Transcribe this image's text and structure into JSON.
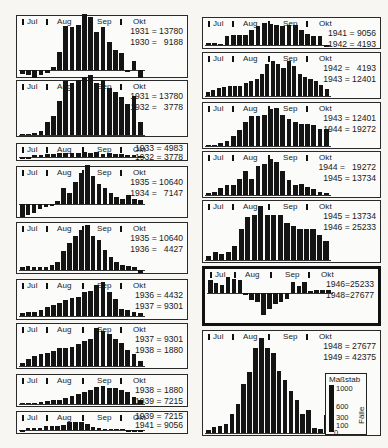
{
  "chart_data": {
    "type": "bar",
    "title": "",
    "xlabel": "Weekly periods Jul–Okt",
    "ylabel": "Fälle",
    "month_labels": [
      "Jul",
      "Aug",
      "Sep",
      "Okt"
    ],
    "scale": {
      "title": "Maßstab",
      "axis_label": "Fälle",
      "ticks": [
        "1000",
        "600",
        "300",
        "100",
        "0"
      ],
      "ylim": [
        0,
        1000
      ]
    },
    "panels": [
      {
        "id": "L1",
        "line1": "1931 = 13780",
        "line2": "1930 =   9188",
        "box": [
          16,
          15,
          172,
          63
        ],
        "baseline": 54,
        "unit": 0.045,
        "values": [
          -80,
          -100,
          -180,
          -120,
          -60,
          60,
          400,
          980,
          950,
          1000,
          1240,
          1180,
          840,
          960,
          620,
          450,
          380,
          -30,
          200,
          -180
        ]
      },
      {
        "id": "L2",
        "line1": "1931 = 13780",
        "line2": "1932 =   3778",
        "box": [
          16,
          80,
          172,
          57
        ],
        "baseline": 54,
        "unit": 0.045,
        "values": [
          0,
          20,
          40,
          100,
          300,
          420,
          750,
          1200,
          1150,
          1220,
          1300,
          1340,
          1160,
          1220,
          1050,
          950,
          840,
          700,
          860,
          280
        ]
      },
      {
        "id": "L3",
        "line1": "1933 = 4983",
        "line2": "1932 = 3778",
        "box": [
          16,
          143,
          172,
          18
        ],
        "baseline": 13,
        "unit": 0.045,
        "values": [
          -20,
          -20,
          40,
          40,
          60,
          60,
          80,
          80,
          100,
          80,
          110,
          100,
          120,
          60,
          100,
          60,
          60,
          40,
          40,
          20
        ]
      },
      {
        "id": "L4",
        "line1": "1935 = 10640",
        "line2": "1934 =   7147",
        "box": [
          16,
          166,
          172,
          52
        ],
        "baseline": 37,
        "unit": 0.045,
        "values": [
          -280,
          -240,
          -200,
          -120,
          -60,
          -20,
          60,
          360,
          240,
          500,
          700,
          860,
          620,
          440,
          360,
          240,
          160,
          120,
          200,
          120,
          100
        ]
      },
      {
        "id": "L5",
        "line1": "1935 = 10640",
        "line2": "1936 =   4427",
        "box": [
          16,
          222,
          172,
          52
        ],
        "baseline": 47,
        "unit": 0.045,
        "values": [
          60,
          80,
          60,
          60,
          60,
          120,
          180,
          420,
          600,
          760,
          900,
          1000,
          760,
          660,
          440,
          280,
          180,
          120,
          100,
          60,
          -60
        ]
      },
      {
        "id": "L6",
        "line1": "1936 = 4432",
        "line2": "1937 = 9301",
        "box": [
          16,
          279,
          172,
          41
        ],
        "baseline": 36,
        "unit": 0.045,
        "values": [
          60,
          80,
          100,
          140,
          200,
          240,
          300,
          360,
          400,
          420,
          540,
          560,
          700,
          760,
          540,
          380,
          160,
          140,
          100,
          60
        ]
      },
      {
        "id": "L7",
        "line1": "1937 = 9301",
        "line2": "1938 = 1880",
        "box": [
          16,
          323,
          172,
          46
        ],
        "baseline": 42,
        "unit": 0.045,
        "values": [
          60,
          160,
          220,
          260,
          280,
          340,
          400,
          400,
          420,
          480,
          560,
          600,
          840,
          780,
          720,
          600,
          520,
          360,
          260,
          120
        ]
      },
      {
        "id": "L8",
        "line1": "1938 = 1880",
        "line2": "1939 = 7215",
        "box": [
          16,
          374,
          172,
          33
        ],
        "baseline": 29,
        "unit": 0.03,
        "values": [
          40,
          40,
          40,
          60,
          100,
          120,
          140,
          200,
          260,
          320,
          400,
          480,
          560,
          600,
          540,
          520,
          480,
          400,
          240,
          120
        ]
      },
      {
        "id": "L9",
        "line1": "1939 = 7215",
        "line2": "1941 = 9056",
        "box": [
          16,
          411,
          172,
          23
        ],
        "baseline": 18,
        "unit": 0.03,
        "values": [
          -40,
          80,
          60,
          60,
          120,
          140,
          140,
          180,
          260,
          260,
          260,
          200,
          100,
          80,
          40,
          40,
          40,
          20,
          -40,
          -40,
          -40
        ]
      },
      {
        "id": "R1",
        "line1": "1941 = 9056",
        "line2": "1942 = 4193",
        "box": [
          202,
          17,
          179,
          32
        ],
        "baseline": 27,
        "unit": 0.035,
        "values": [
          60,
          60,
          20,
          260,
          280,
          280,
          300,
          440,
          540,
          620,
          600,
          560,
          540,
          560,
          560,
          420,
          320,
          260,
          260,
          -20
        ]
      },
      {
        "id": "R2",
        "line1": "1942 =   4193",
        "line2": "1943 = 12401",
        "box": [
          202,
          52,
          179,
          47
        ],
        "baseline": 43,
        "unit": 0.035,
        "values": [
          120,
          160,
          220,
          260,
          300,
          300,
          300,
          380,
          440,
          500,
          640,
          920,
          1000,
          920,
          800,
          1000,
          860,
          640,
          540,
          480,
          420,
          320,
          200
        ]
      },
      {
        "id": "R3",
        "line1": "1943 = 12401",
        "line2": "1944 = 19272",
        "box": [
          202,
          102,
          179,
          47
        ],
        "baseline": 43,
        "unit": 0.035,
        "values": [
          20,
          40,
          80,
          140,
          280,
          460,
          680,
          860,
          860,
          900,
          1060,
          1080,
          900,
          760,
          680,
          640,
          640,
          600,
          500,
          500
        ]
      },
      {
        "id": "R4",
        "line1": "1944 =   19272",
        "line2": "1945 = 13734",
        "box": [
          202,
          151,
          179,
          47
        ],
        "baseline": 43,
        "unit": 0.035,
        "values": [
          60,
          100,
          200,
          300,
          280,
          460,
          680,
          460,
          820,
          880,
          1040,
          940,
          680,
          440,
          300,
          320,
          240,
          180,
          100,
          60
        ]
      },
      {
        "id": "R5",
        "line1": "1945 = 13734",
        "line2": "1946 = 25233",
        "box": [
          202,
          200,
          179,
          63
        ],
        "baseline": 59,
        "unit": 0.045,
        "values": [
          80,
          180,
          140,
          180,
          320,
          700,
          960,
          1000,
          1200,
          1000,
          1000,
          1000,
          820,
          760,
          700,
          700,
          700,
          560,
          420
        ]
      },
      {
        "id": "R6",
        "line1": "1946=25233",
        "line2": "1948=27677",
        "thick": true,
        "box": [
          202,
          266,
          179,
          60
        ],
        "baseline": 24,
        "unit": 0.03,
        "values": [
          420,
          320,
          280,
          520,
          460,
          440,
          -60,
          -220,
          -300,
          -740,
          -540,
          -360,
          -300,
          -200,
          360,
          240,
          380,
          60,
          100,
          100,
          100
        ]
      },
      {
        "id": "R7",
        "line1": "1948 = 27677",
        "line2": "1949 = 42375",
        "box": [
          202,
          330,
          179,
          106
        ],
        "baseline": 102,
        "unit": 0.045,
        "values": [
          60,
          140,
          160,
          200,
          420,
          640,
          1080,
          1360,
          1880,
          2120,
          1880,
          1780,
          1380,
          1180,
          940,
          740,
          420,
          520,
          120,
          100,
          400
        ]
      }
    ]
  },
  "scale_box": {
    "x": 325,
    "y": 373,
    "w": 42,
    "h": 62
  }
}
